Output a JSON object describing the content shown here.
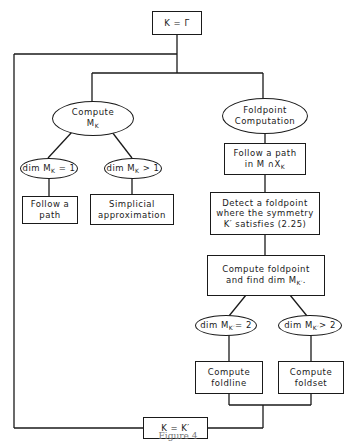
{
  "diagram": {
    "type": "flowchart",
    "nodes": {
      "start": {
        "label": "K = Γ",
        "shape": "rect"
      },
      "compute_mk": {
        "label_line1": "Compute",
        "label_line2": "M",
        "label_sub": "K",
        "shape": "ellipse"
      },
      "foldpoint_computation": {
        "label_line1": "Foldpoint",
        "label_line2": "Computation",
        "shape": "ellipse"
      },
      "dim_eq_1": {
        "label_pre": "dim M",
        "label_sub": "K",
        "label_post": " = 1",
        "shape": "ellipse"
      },
      "dim_gt_1": {
        "label_pre": "dim M",
        "label_sub": "K",
        "label_post": " > 1",
        "shape": "ellipse"
      },
      "follow_path": {
        "label_line1": "Follow a",
        "label_line2": "path",
        "shape": "rect"
      },
      "simplicial": {
        "label_line1": "Simplicial",
        "label_line2": "approximation",
        "shape": "rect"
      },
      "follow_path_mx": {
        "label_line1": "Follow a path",
        "label_line2_pre": "in M ∩X",
        "label_sub": "K",
        "shape": "rect"
      },
      "detect_foldpoint": {
        "label_line1": "Detect a foldpoint",
        "label_line2": "where the symmetry",
        "label_line3": "K′ satisfies (2.25)",
        "shape": "rect"
      },
      "compute_foldpoint": {
        "label_line1": "Compute foldpoint",
        "label_line2_pre": "and find dim M",
        "label_sub": "K′",
        "label_post": ".",
        "shape": "rect"
      },
      "dim_eq_2": {
        "label_pre": "dim M",
        "label_sub": "K′",
        "label_post": "= 2",
        "shape": "ellipse"
      },
      "dim_gt_2": {
        "label_pre": "dim M",
        "label_sub": "K′",
        "label_post": "> 2",
        "shape": "ellipse"
      },
      "compute_foldline": {
        "label_line1": "Compute",
        "label_line2": "foldline",
        "shape": "rect"
      },
      "compute_foldset": {
        "label_line1": "Compute",
        "label_line2": "foldset",
        "shape": "rect"
      },
      "update": {
        "label": "K = K′",
        "shape": "rect"
      }
    },
    "edges": [
      [
        "start",
        "compute_mk"
      ],
      [
        "start",
        "foldpoint_computation"
      ],
      [
        "compute_mk",
        "dim_eq_1"
      ],
      [
        "compute_mk",
        "dim_gt_1"
      ],
      [
        "dim_eq_1",
        "follow_path"
      ],
      [
        "dim_gt_1",
        "simplicial"
      ],
      [
        "foldpoint_computation",
        "follow_path_mx"
      ],
      [
        "follow_path_mx",
        "detect_foldpoint"
      ],
      [
        "detect_foldpoint",
        "compute_foldpoint"
      ],
      [
        "compute_foldpoint",
        "dim_eq_2"
      ],
      [
        "compute_foldpoint",
        "dim_gt_2"
      ],
      [
        "dim_eq_2",
        "compute_foldline"
      ],
      [
        "dim_gt_2",
        "compute_foldset"
      ],
      [
        "compute_foldline",
        "update"
      ],
      [
        "compute_foldset",
        "update"
      ],
      [
        "update",
        "start"
      ]
    ],
    "caption": "Figure 4"
  }
}
